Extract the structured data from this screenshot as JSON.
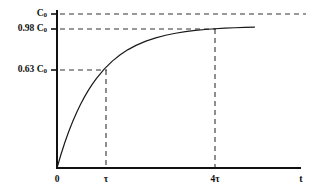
{
  "figure": {
    "background_color": "#ffffff",
    "line_color": "#1a1a1a",
    "dash_color": "#333333"
  },
  "axes": {
    "x_axis_name": "t",
    "y_axis_name": "",
    "origin_label": "0"
  },
  "y_ticks": [
    {
      "label_main": "C",
      "label_sub": "0",
      "value": 1.0,
      "pixel_y": 14
    },
    {
      "label_main": "0.98 C",
      "label_sub": "0",
      "value": 0.98,
      "pixel_y": 29
    },
    {
      "label_main": "0.63 C",
      "label_sub": "0",
      "value": 0.63,
      "pixel_y": 70
    }
  ],
  "x_ticks": [
    {
      "label": "0",
      "value": 0,
      "pixel_x": 57
    },
    {
      "label": "τ",
      "value": 1,
      "pixel_x": 106
    },
    {
      "label": "4τ",
      "value": 4,
      "pixel_x": 215
    }
  ],
  "chart_data": {
    "type": "line",
    "title": "",
    "subtitle": "",
    "xlabel": "t",
    "ylabel": "",
    "grid": false,
    "legend": null,
    "equation": "C(t) = C0 * (1 - exp(-t/tau))",
    "xlim": [
      0,
      5.05
    ],
    "ylim": [
      0,
      1.03
    ],
    "x_tick_labels": [
      "0",
      "τ",
      "4τ",
      "t"
    ],
    "y_tick_labels": [
      "0.63 C0",
      "0.98 C0",
      "C0"
    ],
    "series": [
      {
        "name": "exponential saturation",
        "x": [
          0,
          0.1,
          0.2,
          0.3,
          0.4,
          0.5,
          0.6,
          0.7,
          0.8,
          0.9,
          1.0,
          1.2,
          1.4,
          1.6,
          1.8,
          2.0,
          2.25,
          2.5,
          2.75,
          3.0,
          3.25,
          3.5,
          3.75,
          4.0,
          4.25,
          4.5,
          4.75,
          5.0
        ],
        "y": [
          0,
          0.0952,
          0.1813,
          0.2592,
          0.3297,
          0.3935,
          0.4512,
          0.5034,
          0.5507,
          0.5934,
          0.6321,
          0.6988,
          0.7534,
          0.7981,
          0.8347,
          0.8647,
          0.8946,
          0.9179,
          0.9361,
          0.9502,
          0.9612,
          0.9698,
          0.9765,
          0.9817,
          0.9857,
          0.9889,
          0.9913,
          0.9933
        ]
      }
    ],
    "annotations": [
      {
        "type": "hline",
        "y": 1.0,
        "label": "C0",
        "style": "dashed"
      },
      {
        "type": "hline",
        "y": 0.98,
        "label": "0.98 C0",
        "style": "dashed"
      },
      {
        "type": "hline",
        "y": 0.63,
        "label": "0.63 C0",
        "style": "dashed"
      },
      {
        "type": "vline",
        "x": 1,
        "label": "τ",
        "style": "dashed"
      },
      {
        "type": "vline",
        "x": 4,
        "label": "4τ",
        "style": "dashed"
      }
    ]
  }
}
